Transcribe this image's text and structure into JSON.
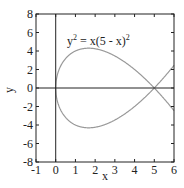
{
  "chart_data": {
    "type": "line",
    "title": "",
    "xlabel": "x",
    "ylabel": "y",
    "xlim": [
      -1,
      6
    ],
    "ylim": [
      -8,
      8
    ],
    "x_ticks": [
      -1,
      0,
      1,
      2,
      3,
      4,
      5,
      6
    ],
    "y_ticks": [
      -8,
      -6,
      -4,
      -2,
      0,
      2,
      4,
      6,
      8
    ],
    "x_tick_labels": [
      "-1",
      "0",
      "1",
      "2",
      "3",
      "4",
      "5",
      "6"
    ],
    "y_tick_labels": [
      "-8",
      "-6",
      "-4",
      "-2",
      "0",
      "2",
      "4",
      "6",
      "8"
    ],
    "grid": false,
    "reference_lines": [
      {
        "orientation": "horizontal",
        "value": 0
      },
      {
        "orientation": "vertical",
        "value": 0
      }
    ],
    "annotation": {
      "text_base": "y",
      "text_rest": " = x(5 - x)",
      "sup": "2",
      "x": 0.6,
      "y": 5.7
    },
    "series": [
      {
        "name": "upper branch: y = sqrt(x)(5 - x)",
        "color": "#999999",
        "x": [
          0,
          0.05,
          0.2,
          0.5,
          1,
          1.667,
          2,
          2.5,
          3,
          3.5,
          4,
          4.5,
          5,
          5.5,
          6
        ],
        "y": [
          0,
          1.11,
          2.15,
          3.18,
          4.0,
          4.3,
          4.24,
          3.95,
          3.46,
          2.81,
          2.0,
          1.06,
          0,
          -1.17,
          -2.45
        ]
      },
      {
        "name": "lower branch: y = -sqrt(x)(5 - x)",
        "color": "#999999",
        "x": [
          0,
          0.05,
          0.2,
          0.5,
          1,
          1.667,
          2,
          2.5,
          3,
          3.5,
          4,
          4.5,
          5,
          5.5,
          6
        ],
        "y": [
          0,
          -1.11,
          -2.15,
          -3.18,
          -4.0,
          -4.3,
          -4.24,
          -3.95,
          -3.46,
          -2.81,
          -2.0,
          -1.06,
          0,
          1.17,
          2.45
        ]
      }
    ]
  }
}
